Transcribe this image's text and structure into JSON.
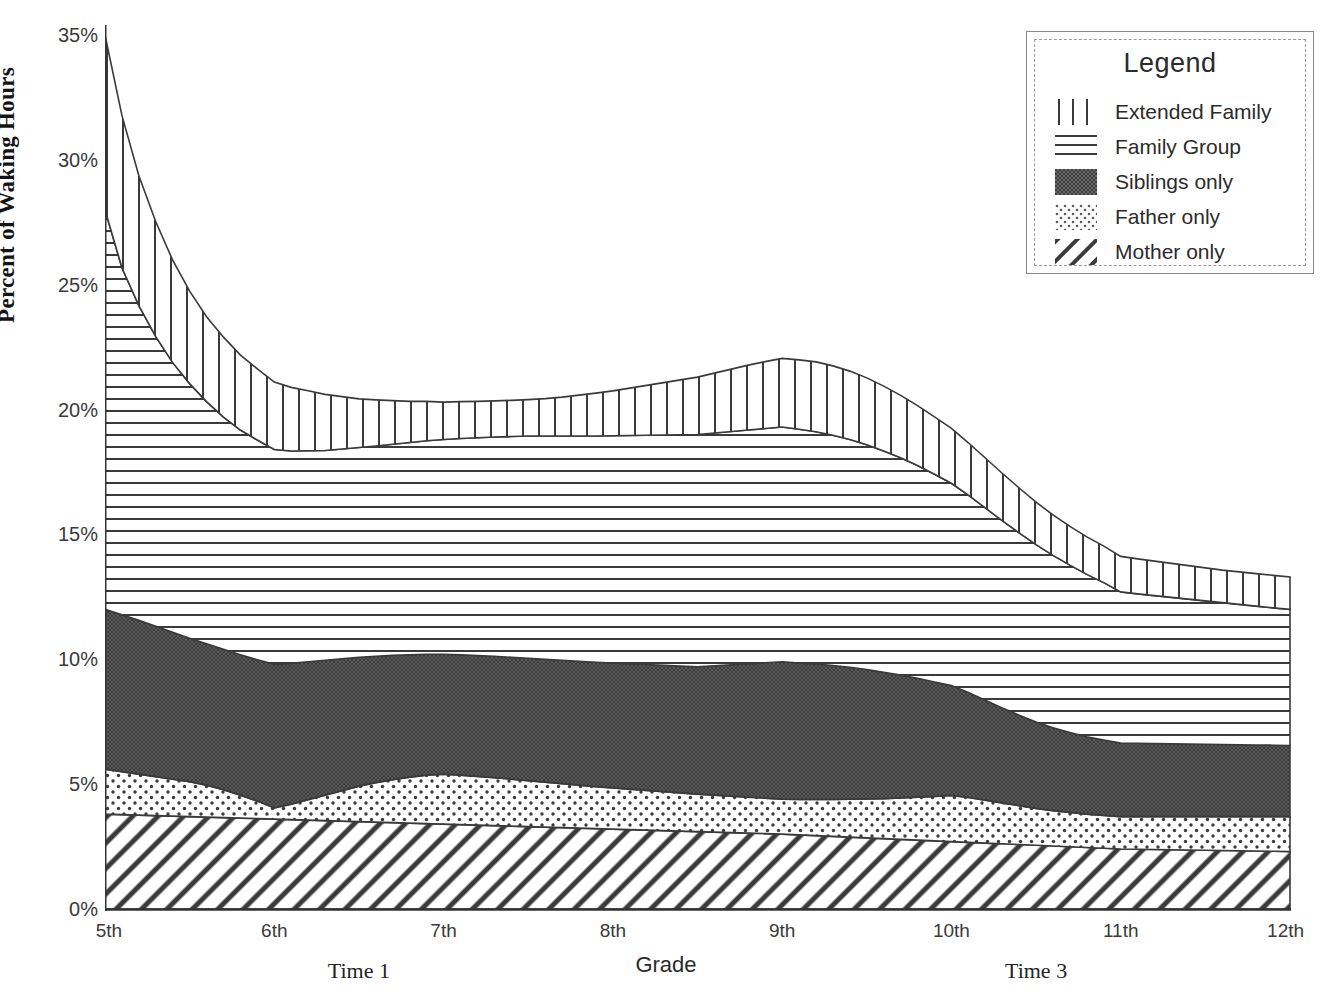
{
  "chart_data": {
    "type": "area",
    "title": "",
    "subtitle": "",
    "xlabel": "Grade",
    "ylabel": "Percent of Waking Hours",
    "stacked": true,
    "grid": false,
    "legend_position": "top-right",
    "legend_title": "Legend",
    "xlim": [
      5,
      12
    ],
    "ylim": [
      0,
      35
    ],
    "y_ticks": [
      "0%",
      "5%",
      "10%",
      "15%",
      "20%",
      "25%",
      "30%",
      "35%"
    ],
    "y_tick_values": [
      0,
      5,
      10,
      15,
      20,
      25,
      30,
      35
    ],
    "x_ticks": [
      "5th",
      "6th",
      "7th",
      "8th",
      "9th",
      "10th",
      "11th",
      "12th"
    ],
    "x_tick_values": [
      5,
      6,
      7,
      8,
      9,
      10,
      11,
      12
    ],
    "annotations": [
      {
        "text": "Time 1",
        "x": 6.5
      },
      {
        "text": "Time 3",
        "x": 10.5
      }
    ],
    "x": [
      5.0,
      5.1,
      5.2,
      5.3,
      5.4,
      5.5,
      5.6,
      5.7,
      5.8,
      5.9,
      6.0,
      6.1,
      6.2,
      6.3,
      6.4,
      6.5,
      6.6,
      6.7,
      6.8,
      6.9,
      7.0,
      7.1,
      7.2,
      7.3,
      7.4,
      7.5,
      7.6,
      7.7,
      7.8,
      7.9,
      8.0,
      8.1,
      8.2,
      8.3,
      8.4,
      8.5,
      8.6,
      8.7,
      8.8,
      8.9,
      9.0,
      9.1,
      9.2,
      9.3,
      9.4,
      9.5,
      9.6,
      9.7,
      9.8,
      9.9,
      10.0,
      10.1,
      10.2,
      10.3,
      10.4,
      10.5,
      10.6,
      10.7,
      10.8,
      10.9,
      11.0,
      11.1,
      11.2,
      11.3,
      11.4,
      11.5,
      11.6,
      11.7,
      11.8,
      11.9,
      12.0
    ],
    "series": [
      {
        "name": "Mother only",
        "pattern": "diagonal-lines",
        "values": [
          3.8,
          3.78,
          3.76,
          3.74,
          3.72,
          3.7,
          3.68,
          3.66,
          3.64,
          3.62,
          3.6,
          3.58,
          3.56,
          3.54,
          3.52,
          3.5,
          3.48,
          3.46,
          3.44,
          3.42,
          3.4,
          3.38,
          3.36,
          3.34,
          3.32,
          3.3,
          3.28,
          3.26,
          3.24,
          3.22,
          3.2,
          3.18,
          3.16,
          3.14,
          3.12,
          3.1,
          3.08,
          3.06,
          3.04,
          3.02,
          3.0,
          2.97,
          2.94,
          2.91,
          2.88,
          2.85,
          2.82,
          2.79,
          2.76,
          2.73,
          2.7,
          2.67,
          2.64,
          2.61,
          2.58,
          2.55,
          2.52,
          2.49,
          2.46,
          2.43,
          2.4,
          2.39,
          2.38,
          2.37,
          2.36,
          2.35,
          2.34,
          2.33,
          2.32,
          2.31,
          2.3
        ]
      },
      {
        "name": "Father only",
        "pattern": "dots",
        "values": [
          1.8,
          1.72,
          1.64,
          1.56,
          1.48,
          1.4,
          1.28,
          1.12,
          0.92,
          0.7,
          0.45,
          0.62,
          0.82,
          1.02,
          1.22,
          1.42,
          1.58,
          1.72,
          1.84,
          1.94,
          2.0,
          1.98,
          1.95,
          1.92,
          1.88,
          1.84,
          1.8,
          1.76,
          1.72,
          1.68,
          1.65,
          1.62,
          1.59,
          1.56,
          1.53,
          1.5,
          1.48,
          1.46,
          1.44,
          1.42,
          1.4,
          1.42,
          1.45,
          1.48,
          1.52,
          1.56,
          1.6,
          1.66,
          1.72,
          1.78,
          1.85,
          1.8,
          1.72,
          1.64,
          1.56,
          1.48,
          1.42,
          1.38,
          1.34,
          1.32,
          1.3,
          1.31,
          1.32,
          1.33,
          1.34,
          1.35,
          1.36,
          1.37,
          1.38,
          1.39,
          1.4
        ]
      },
      {
        "name": "Siblings only",
        "pattern": "solid-dark",
        "values": [
          6.4,
          6.28,
          6.16,
          6.02,
          5.88,
          5.74,
          5.66,
          5.62,
          5.62,
          5.66,
          5.75,
          5.64,
          5.52,
          5.4,
          5.28,
          5.16,
          5.06,
          4.98,
          4.9,
          4.84,
          4.8,
          4.82,
          4.84,
          4.86,
          4.88,
          4.9,
          4.92,
          4.94,
          4.96,
          4.98,
          5.0,
          5.02,
          5.04,
          5.06,
          5.08,
          5.1,
          5.18,
          5.26,
          5.34,
          5.42,
          5.5,
          5.46,
          5.42,
          5.36,
          5.28,
          5.18,
          5.06,
          4.92,
          4.76,
          4.58,
          4.4,
          4.2,
          4.0,
          3.8,
          3.62,
          3.46,
          3.32,
          3.2,
          3.1,
          3.02,
          2.95,
          2.94,
          2.93,
          2.92,
          2.91,
          2.9,
          2.89,
          2.88,
          2.87,
          2.86,
          2.85
        ]
      },
      {
        "name": "Family Group",
        "pattern": "horizontal-lines",
        "values": [
          16.0,
          13.9,
          12.6,
          11.6,
          10.8,
          10.2,
          9.7,
          9.3,
          9.0,
          8.8,
          8.6,
          8.5,
          8.45,
          8.4,
          8.4,
          8.4,
          8.42,
          8.45,
          8.5,
          8.55,
          8.6,
          8.66,
          8.72,
          8.78,
          8.84,
          8.9,
          8.94,
          8.98,
          9.02,
          9.06,
          9.1,
          9.14,
          9.18,
          9.22,
          9.26,
          9.3,
          9.32,
          9.34,
          9.36,
          9.38,
          9.4,
          9.36,
          9.3,
          9.22,
          9.12,
          9.0,
          8.86,
          8.7,
          8.52,
          8.32,
          8.1,
          7.9,
          7.7,
          7.5,
          7.3,
          7.1,
          6.9,
          6.7,
          6.5,
          6.3,
          6.05,
          5.98,
          5.92,
          5.86,
          5.8,
          5.74,
          5.68,
          5.62,
          5.56,
          5.5,
          5.45
        ]
      },
      {
        "name": "Extended Family",
        "pattern": "vertical-lines",
        "values": [
          7.0,
          6.1,
          5.2,
          4.6,
          4.1,
          3.7,
          3.4,
          3.2,
          3.0,
          2.85,
          2.7,
          2.55,
          2.4,
          2.25,
          2.1,
          1.95,
          1.85,
          1.75,
          1.65,
          1.58,
          1.5,
          1.48,
          1.46,
          1.45,
          1.45,
          1.46,
          1.5,
          1.56,
          1.64,
          1.72,
          1.8,
          1.9,
          2.0,
          2.1,
          2.2,
          2.3,
          2.4,
          2.5,
          2.6,
          2.68,
          2.75,
          2.78,
          2.8,
          2.78,
          2.74,
          2.68,
          2.6,
          2.5,
          2.4,
          2.3,
          2.2,
          2.1,
          2.0,
          1.9,
          1.8,
          1.7,
          1.62,
          1.55,
          1.5,
          1.46,
          1.42,
          1.4,
          1.38,
          1.36,
          1.34,
          1.32,
          1.3,
          1.3,
          1.3,
          1.3,
          1.3
        ]
      }
    ]
  },
  "legend": {
    "title": "Legend",
    "items": [
      {
        "label": "Extended Family",
        "pattern": "vertical-lines"
      },
      {
        "label": "Family Group",
        "pattern": "horizontal-lines"
      },
      {
        "label": "Siblings only",
        "pattern": "solid-dark"
      },
      {
        "label": "Father only",
        "pattern": "dots"
      },
      {
        "label": "Mother only",
        "pattern": "diagonal-lines"
      }
    ]
  },
  "colors": {
    "ink": "#2b2b2b",
    "siblings_fill": "#4d4d4d",
    "axis": "#333333"
  }
}
